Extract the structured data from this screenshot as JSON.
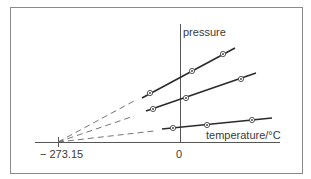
{
  "diagram": {
    "labels": {
      "y_axis": "pressure",
      "x_axis": "temperature/°C",
      "absolute_zero": "− 273.15",
      "origin": "0"
    },
    "colors": {
      "frame": "#8a8a8a",
      "axis": "#555555",
      "line": "#2a2a2a",
      "dash": "#666666",
      "text": "#3a3a3a"
    },
    "series": [
      {
        "name": "gas-sample-1",
        "points": [
          [
            150,
            93
          ],
          [
            192,
            71
          ],
          [
            223,
            54
          ]
        ]
      },
      {
        "name": "gas-sample-2",
        "points": [
          [
            153,
            109
          ],
          [
            186,
            98
          ],
          [
            241,
            79
          ]
        ]
      },
      {
        "name": "gas-sample-3",
        "points": [
          [
            173,
            128
          ],
          [
            207,
            125
          ],
          [
            252,
            120
          ]
        ]
      }
    ]
  }
}
